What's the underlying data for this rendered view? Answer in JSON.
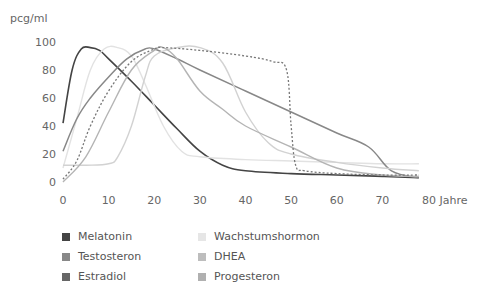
{
  "chart_data": {
    "type": "line",
    "title": "",
    "ylabel": "pcg/ml",
    "xlabel": "Jahre",
    "xlim": [
      0,
      80
    ],
    "ylim": [
      0,
      100
    ],
    "x_ticks": [
      0,
      10,
      20,
      30,
      40,
      50,
      60,
      70,
      80
    ],
    "x_tick_labels": [
      "0",
      "10",
      "20",
      "30",
      "40",
      "50",
      "60",
      "70",
      "80 Jahre"
    ],
    "y_ticks": [
      0,
      20,
      40,
      60,
      80,
      100
    ],
    "y_tick_labels": [
      "0",
      "20",
      "40",
      "60",
      "80",
      "100"
    ],
    "grid": false,
    "legend_position": "bottom",
    "series": [
      {
        "name": "Melatonin",
        "color": "#444444",
        "dash": "",
        "width": 1.6,
        "x": [
          0,
          2,
          4,
          6,
          8,
          10,
          15,
          20,
          25,
          30,
          35,
          40,
          50,
          60,
          70,
          78
        ],
        "y": [
          42,
          80,
          95,
          96,
          94,
          88,
          72,
          55,
          38,
          22,
          12,
          8,
          6,
          5,
          4,
          3
        ]
      },
      {
        "name": "Wachstumshormon",
        "color": "#e2e2e2",
        "dash": "",
        "width": 1.4,
        "x": [
          0,
          3,
          6,
          9,
          12,
          15,
          18,
          22,
          26,
          30,
          40,
          50,
          60,
          70,
          78
        ],
        "y": [
          10,
          45,
          80,
          95,
          96,
          90,
          70,
          40,
          22,
          18,
          16,
          15,
          14,
          13,
          13
        ]
      },
      {
        "name": "Testosteron",
        "color": "#888888",
        "dash": "",
        "width": 1.5,
        "x": [
          0,
          3,
          6,
          10,
          14,
          18,
          20,
          25,
          30,
          40,
          50,
          60,
          67,
          72,
          78
        ],
        "y": [
          22,
          45,
          60,
          75,
          88,
          95,
          95,
          88,
          80,
          65,
          50,
          35,
          25,
          8,
          3
        ]
      },
      {
        "name": "DHEA",
        "color": "#d2d2d2",
        "dash": "",
        "width": 1.4,
        "x": [
          0,
          5,
          10,
          12,
          15,
          18,
          20,
          25,
          30,
          35,
          40,
          45,
          50,
          60,
          70,
          78
        ],
        "y": [
          12,
          12,
          13,
          18,
          40,
          75,
          90,
          96,
          96,
          85,
          50,
          28,
          20,
          14,
          10,
          8
        ]
      },
      {
        "name": "Progesteron",
        "color": "#b4b4b4",
        "dash": "",
        "width": 1.4,
        "x": [
          0,
          5,
          10,
          15,
          20,
          22,
          25,
          30,
          35,
          40,
          50,
          60,
          70,
          78
        ],
        "y": [
          0,
          18,
          50,
          80,
          94,
          96,
          88,
          65,
          52,
          40,
          25,
          10,
          5,
          4
        ]
      },
      {
        "name": "Estradiol",
        "color": "#777777",
        "dash": "2,2",
        "width": 1.3,
        "x": [
          0,
          3,
          6,
          10,
          15,
          20,
          22,
          30,
          40,
          46,
          49,
          50,
          51,
          53,
          60,
          70,
          78
        ],
        "y": [
          2,
          15,
          40,
          65,
          86,
          95,
          96,
          94,
          90,
          86,
          80,
          40,
          12,
          8,
          6,
          5,
          5
        ]
      }
    ]
  },
  "axis": {
    "y_title": "pcg/ml",
    "x_title": "Jahre"
  },
  "legend": {
    "items": [
      {
        "label": "Melatonin",
        "color": "#444444"
      },
      {
        "label": "Testosteron",
        "color": "#888888"
      },
      {
        "label": "Estradiol",
        "color": "#666666"
      },
      {
        "label": "Wachstumshormon",
        "color": "#e6e6e6"
      },
      {
        "label": "DHEA",
        "color": "#bdbdbd"
      },
      {
        "label": "Progesteron",
        "color": "#b0b0b0"
      }
    ]
  }
}
